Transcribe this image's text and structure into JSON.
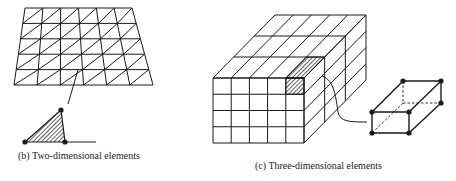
{
  "figure": {
    "panels": [
      {
        "id": "b",
        "caption": "(b) Two-dimensional elements",
        "mesh": {
          "type": "triangular",
          "rows": 5,
          "cols": 6
        },
        "detail_element": "triangle",
        "detail_nodes": 3
      },
      {
        "id": "c",
        "caption": "(c) Three-dimensional elements",
        "mesh": {
          "type": "hexahedral",
          "front_rows": 4,
          "front_cols": 5,
          "depth_layers": 3
        },
        "detail_element": "hexahedron",
        "detail_nodes": 8
      }
    ],
    "colors": {
      "line": "#1a1a1a",
      "background": "#ffffff"
    }
  }
}
